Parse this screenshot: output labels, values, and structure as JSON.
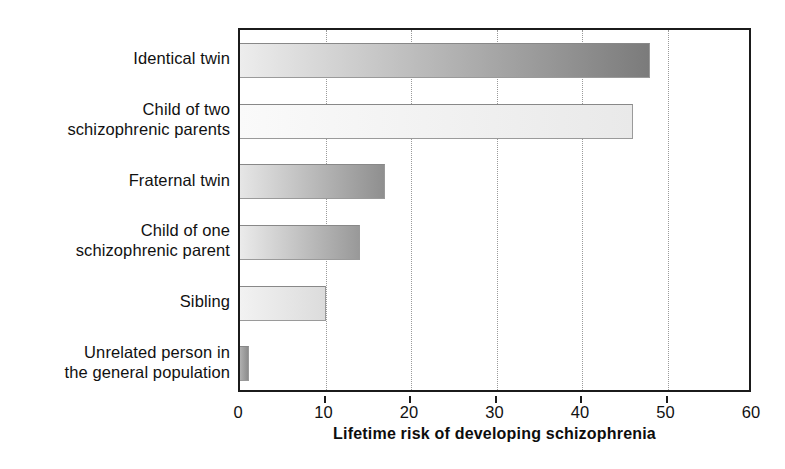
{
  "chart_data": {
    "type": "bar",
    "orientation": "horizontal",
    "title": "",
    "xlabel": "Lifetime risk of developing schizophrenia",
    "ylabel": "",
    "xlim": [
      0,
      60
    ],
    "xticks": [
      0,
      10,
      20,
      30,
      40,
      50,
      60
    ],
    "xtick_labels": [
      "0",
      "10",
      "20",
      "30",
      "40",
      "50",
      "60"
    ],
    "grid": "vertical-dotted",
    "legend": "none",
    "categories": [
      "Identical twin",
      "Child of two schizophrenic parents",
      "Fraternal twin",
      "Child of one schizophrenic parent",
      "Sibling",
      "Unrelated person in the general population"
    ],
    "values": [
      48,
      46,
      17,
      14,
      10,
      1
    ],
    "bars": [
      {
        "label_lines": [
          "Identical twin"
        ],
        "value": 48,
        "fill_start": "#ededed",
        "fill_end": "#7b7b7b"
      },
      {
        "label_lines": [
          "Child of two",
          "schizophrenic parents"
        ],
        "value": 46,
        "fill_start": "#fafafa",
        "fill_end": "#e9e9e9"
      },
      {
        "label_lines": [
          "Fraternal twin"
        ],
        "value": 17,
        "fill_start": "#e6e6e6",
        "fill_end": "#8f8f8f"
      },
      {
        "label_lines": [
          "Child of one",
          "schizophrenic parent"
        ],
        "value": 14,
        "fill_start": "#ebebeb",
        "fill_end": "#999999"
      },
      {
        "label_lines": [
          "Sibling"
        ],
        "value": 10,
        "fill_start": "#f2f2f2",
        "fill_end": "#dcdcdc"
      },
      {
        "label_lines": [
          "Unrelated person in",
          "the general population"
        ],
        "value": 1,
        "fill_start": "#b0b0b0",
        "fill_end": "#8c8c8c"
      }
    ]
  },
  "colors": {
    "axis": "#1b1b1b",
    "grid": "#9a9a9a",
    "text": "#111111",
    "background": "#ffffff"
  }
}
